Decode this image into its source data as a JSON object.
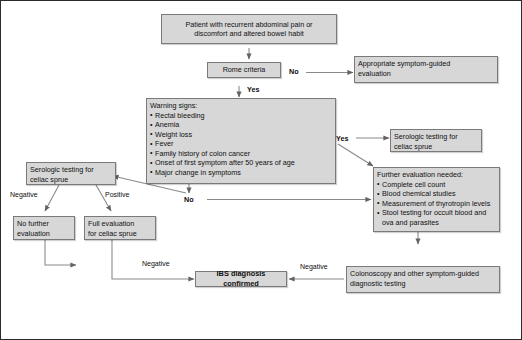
{
  "diagram": {
    "accent_color": "#d7d7d7",
    "border_color": "#7a7a7a",
    "frame_color": "#2b2b2b",
    "nodes": {
      "patient": {
        "line1": "Patient with recurrent abdominal pain or",
        "line2": "discomfort and altered bowel habit"
      },
      "rome": {
        "label": "Rome criteria"
      },
      "appropriate": {
        "line1": "Appropriate symptom-guided",
        "line2": "evaluation"
      },
      "warning": {
        "header": "Warning signs:",
        "items": [
          "Rectal bleeding",
          "Anemia",
          "Weight loss",
          "Fever",
          "Family history of colon cancer",
          "Onset of first symptom after 50 years of age",
          "Major change in symptoms"
        ]
      },
      "serologic_right": {
        "line1": "Serologic testing for",
        "line2": "celiac sprue"
      },
      "serologic_left": {
        "line1": "Serologic testing for",
        "line2": "celiac sprue"
      },
      "further": {
        "header": "Further evaluation needed:",
        "items": [
          "Complete cell count",
          "Blood chemical studies",
          "Measurement of thyrotropin levels",
          "Stool testing for occult blood and ova and parasites"
        ]
      },
      "no_further": {
        "line1": "No further",
        "line2": "evaluation"
      },
      "full_eval": {
        "line1": "Full evaluation",
        "line2": "for celiac sprue"
      },
      "ibs": {
        "label": "IBS diagnosis confirmed"
      },
      "colonoscopy": {
        "line1": "Colonoscopy and other symptom-guided",
        "line2": "diagnostic testing"
      }
    },
    "edge_labels": {
      "rome_no": "No",
      "rome_yes": "Yes",
      "warning_yes": "Yes",
      "warning_no": "No",
      "serologic_negative": "Negative",
      "serologic_positive": "Positive",
      "full_eval_negative": "Negative",
      "colonoscopy_negative": "Negative"
    }
  }
}
